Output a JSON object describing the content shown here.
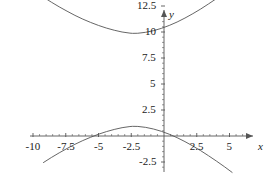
{
  "chart_data": {
    "type": "line",
    "title": "",
    "xlabel": "x",
    "ylabel": "y",
    "grid": false,
    "legend": "none",
    "xlim": [
      -11.2,
      6.5
    ],
    "ylim": [
      -3.6,
      14.2
    ],
    "xticks": [
      -10,
      -7.5,
      -5,
      -2.5,
      2.5,
      5
    ],
    "yticks": [
      -2.5,
      2.5,
      5,
      7.5,
      10,
      12.5
    ],
    "xtick_labels": [
      "-10",
      "-7.5",
      "-5",
      "-2.5",
      "2.5",
      "5"
    ],
    "ytick_labels": [
      "-2.5",
      "2.5",
      "5",
      "7.5",
      "10",
      "12.5"
    ],
    "series": [
      {
        "name": "upper-branch",
        "color": "#555555",
        "x": [
          -9.2,
          -8.6,
          -8.0,
          -7.4,
          -6.8,
          -6.2,
          -5.6,
          -5.0,
          -4.4,
          -3.8,
          -3.2,
          -2.6,
          -2.4,
          -2.0,
          -1.4,
          -0.8,
          -0.2,
          0.4,
          1.0,
          1.6,
          2.2,
          2.8,
          3.4,
          4.0,
          4.6,
          5.2
        ],
        "y": [
          13.35,
          12.87,
          12.42,
          12.0,
          11.6,
          11.24,
          10.92,
          10.63,
          10.38,
          10.17,
          10.0,
          9.89,
          9.87,
          9.88,
          9.97,
          10.13,
          10.35,
          10.63,
          10.96,
          11.34,
          11.76,
          12.21,
          12.7,
          13.21,
          13.74,
          14.3
        ]
      },
      {
        "name": "lower-branch",
        "color": "#555555",
        "x": [
          -9.2,
          -8.6,
          -8.0,
          -7.4,
          -6.8,
          -6.2,
          -5.6,
          -5.0,
          -4.4,
          -3.8,
          -3.2,
          -2.6,
          -2.4,
          -2.0,
          -1.4,
          -0.8,
          -0.2,
          0.4,
          1.0,
          1.6,
          2.2,
          2.8,
          3.4,
          4.0,
          4.6,
          5.2
        ],
        "y": [
          -2.55,
          -2.07,
          -1.62,
          -1.2,
          -0.8,
          -0.44,
          -0.12,
          0.17,
          0.42,
          0.63,
          0.8,
          0.91,
          0.93,
          0.92,
          0.83,
          0.67,
          0.45,
          0.17,
          -0.16,
          -0.54,
          -0.96,
          -1.41,
          -1.9,
          -2.41,
          -2.94,
          -3.5
        ]
      }
    ],
    "annotations": {
      "upper_vertex": {
        "x": -2.4,
        "y": 9.87
      },
      "lower_vertex": {
        "x": -2.4,
        "y": 0.93
      }
    }
  },
  "axis": {
    "x_name": "x",
    "y_name": "y",
    "axis_color": "#555555",
    "curve_color": "#555555"
  },
  "labels": {
    "y": [
      {
        "text": "12.5",
        "value": 12.5
      },
      {
        "text": "10",
        "value": 10
      },
      {
        "text": "7.5",
        "value": 7.5
      },
      {
        "text": "5",
        "value": 5
      },
      {
        "text": "2.5",
        "value": 2.5
      },
      {
        "text": "-2.5",
        "value": -2.5
      }
    ],
    "x": [
      {
        "text": "-10",
        "value": -10
      },
      {
        "text": "-7.5",
        "value": -7.5
      },
      {
        "text": "-5",
        "value": -5
      },
      {
        "text": "-2.5",
        "value": -2.5
      },
      {
        "text": "2.5",
        "value": 2.5
      },
      {
        "text": "5",
        "value": 5
      }
    ]
  }
}
